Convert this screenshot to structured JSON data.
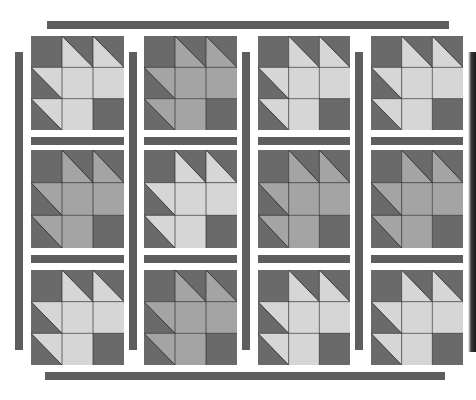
{
  "colors": {
    "background": "#ffffff",
    "sashing": "#5e5e5e",
    "dark": "#6a6a6a",
    "light": "#d6d6d6",
    "medium": "#a4a4a4",
    "seam": "#222222"
  },
  "layout": {
    "rows": 3,
    "columns": 4,
    "block_grid": "3x3 patch",
    "block_pattern": [
      [
        "dark",
        "hst",
        "hst"
      ],
      [
        "hst",
        "fill",
        "fill"
      ],
      [
        "hst",
        "fill",
        "dark"
      ]
    ]
  },
  "blocks": [
    {
      "row": 0,
      "col": 0,
      "tone": "light"
    },
    {
      "row": 0,
      "col": 1,
      "tone": "medium"
    },
    {
      "row": 0,
      "col": 2,
      "tone": "light"
    },
    {
      "row": 0,
      "col": 3,
      "tone": "light"
    },
    {
      "row": 1,
      "col": 0,
      "tone": "medium"
    },
    {
      "row": 1,
      "col": 1,
      "tone": "light"
    },
    {
      "row": 1,
      "col": 2,
      "tone": "medium"
    },
    {
      "row": 1,
      "col": 3,
      "tone": "medium"
    },
    {
      "row": 2,
      "col": 0,
      "tone": "light"
    },
    {
      "row": 2,
      "col": 1,
      "tone": "medium"
    },
    {
      "row": 2,
      "col": 2,
      "tone": "light"
    },
    {
      "row": 2,
      "col": 3,
      "tone": "light"
    }
  ],
  "sashing": {
    "top_border": true,
    "bottom_border": true,
    "vertical_strips": 4,
    "horizontal_strips_per_column": 2
  }
}
